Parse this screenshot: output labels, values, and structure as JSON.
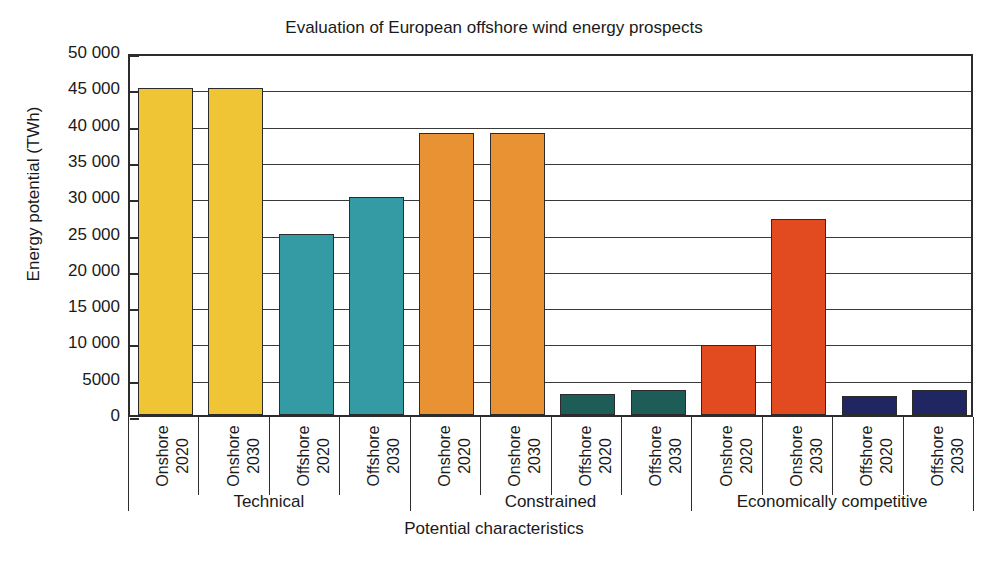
{
  "chart_data": {
    "type": "bar",
    "title": "Evaluation of European offshore wind energy prospects",
    "xlabel": "Potential characteristics",
    "ylabel": "Energy potential (TWh)",
    "ylim": [
      0,
      50000
    ],
    "ytick_step": 5000,
    "grid": true,
    "legend": "none",
    "ytick_labels": [
      "0",
      "5000",
      "10 000",
      "15 000",
      "20 000",
      "25 000",
      "30 000",
      "35 000",
      "40 000",
      "45 000",
      "50 000"
    ],
    "ytick_values": [
      0,
      5000,
      10000,
      15000,
      20000,
      25000,
      30000,
      35000,
      40000,
      45000,
      50000
    ],
    "group_labels": [
      "Technical",
      "Constrained",
      "Economically competitive"
    ],
    "categories": [
      "Onshore 2020",
      "Onshore 2030",
      "Offshore 2020",
      "Offshore 2030",
      "Onshore 2020",
      "Onshore 2030",
      "Offshore 2020",
      "Offshore 2030",
      "Onshore 2020",
      "Onshore 2030",
      "Offshore 2020",
      "Offshore 2030"
    ],
    "values": [
      45000,
      45000,
      25000,
      30000,
      38800,
      38800,
      2900,
      3500,
      9700,
      27000,
      2600,
      3500
    ],
    "bars": [
      {
        "group": "Technical",
        "site": "Onshore",
        "year": "2020",
        "label_line1": "Onshore",
        "label_line2": "2020",
        "value": 45000,
        "color": "#EFC536"
      },
      {
        "group": "Technical",
        "site": "Onshore",
        "year": "2030",
        "label_line1": "Onshore",
        "label_line2": "2030",
        "value": 45000,
        "color": "#EFC536"
      },
      {
        "group": "Technical",
        "site": "Offshore",
        "year": "2020",
        "label_line1": "Offshore",
        "label_line2": "2020",
        "value": 25000,
        "color": "#349AA4"
      },
      {
        "group": "Technical",
        "site": "Offshore",
        "year": "2030",
        "label_line1": "Offshore",
        "label_line2": "2030",
        "value": 30000,
        "color": "#349AA4"
      },
      {
        "group": "Constrained",
        "site": "Onshore",
        "year": "2020",
        "label_line1": "Onshore",
        "label_line2": "2020",
        "value": 38800,
        "color": "#E99234"
      },
      {
        "group": "Constrained",
        "site": "Onshore",
        "year": "2030",
        "label_line1": "Onshore",
        "label_line2": "2030",
        "value": 38800,
        "color": "#E99234"
      },
      {
        "group": "Constrained",
        "site": "Offshore",
        "year": "2020",
        "label_line1": "Offshore",
        "label_line2": "2020",
        "value": 2900,
        "color": "#1E5C57"
      },
      {
        "group": "Constrained",
        "site": "Offshore",
        "year": "2030",
        "label_line1": "Offshore",
        "label_line2": "2030",
        "value": 3500,
        "color": "#1E5C57"
      },
      {
        "group": "Economically competitive",
        "site": "Onshore",
        "year": "2020",
        "label_line1": "Onshore",
        "label_line2": "2020",
        "value": 9700,
        "color": "#E24A1F"
      },
      {
        "group": "Economically competitive",
        "site": "Onshore",
        "year": "2030",
        "label_line1": "Onshore",
        "label_line2": "2030",
        "value": 27000,
        "color": "#E24A1F"
      },
      {
        "group": "Economically competitive",
        "site": "Offshore",
        "year": "2020",
        "label_line1": "Offshore",
        "label_line2": "2020",
        "value": 2600,
        "color": "#202662"
      },
      {
        "group": "Economically competitive",
        "site": "Offshore",
        "year": "2030",
        "label_line1": "Offshore",
        "label_line2": "2030",
        "value": 3500,
        "color": "#202662"
      }
    ],
    "colors": {
      "technical_onshore": "#EFC536",
      "technical_offshore": "#349AA4",
      "constrained_onshore": "#E99234",
      "constrained_offshore": "#1E5C57",
      "economic_onshore": "#E24A1F",
      "economic_offshore": "#202662",
      "axis": "#2c2c2c",
      "background": "#ffffff"
    }
  },
  "caption": ""
}
